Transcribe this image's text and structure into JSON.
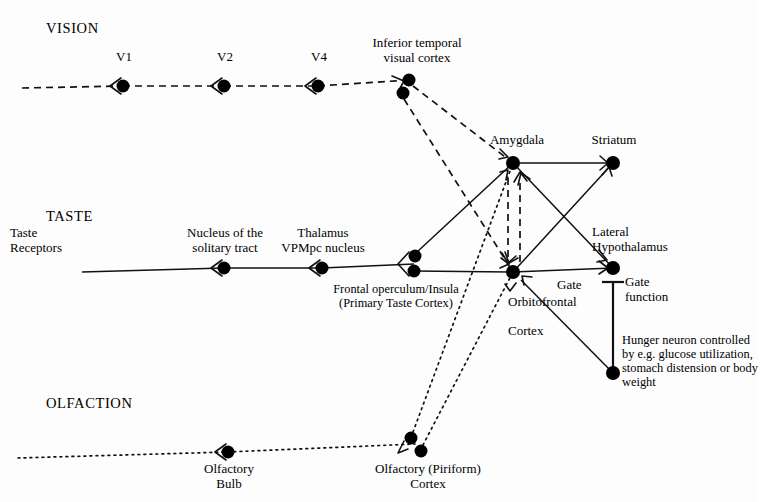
{
  "diagram": {
    "colors": {
      "ink": "#111111",
      "background": "#ffffff"
    },
    "modalities": [
      {
        "id": "vision",
        "label": "VISION",
        "x": 46,
        "y": 20
      },
      {
        "id": "taste",
        "label": "TASTE",
        "x": 46,
        "y": 208
      },
      {
        "id": "olfaction",
        "label": "OLFACTION",
        "x": 46,
        "y": 395
      }
    ],
    "labels": [
      {
        "id": "v1",
        "text": "V1",
        "x": 110,
        "y": 50,
        "align": "center",
        "width": 28,
        "size": "node-label"
      },
      {
        "id": "v2",
        "text": "V2",
        "x": 211,
        "y": 50,
        "align": "center",
        "width": 28,
        "size": "node-label"
      },
      {
        "id": "v4",
        "text": "V4",
        "x": 305,
        "y": 50,
        "align": "center",
        "width": 28,
        "size": "node-label"
      },
      {
        "id": "inferior-temporal-visual-cortex",
        "text": "Inferior temporal\nvisual cortex",
        "x": 358,
        "y": 36,
        "align": "center",
        "width": 118,
        "size": "node-label"
      },
      {
        "id": "amygdala",
        "text": "Amygdala",
        "x": 478,
        "y": 133,
        "align": "center",
        "width": 78,
        "size": "node-label"
      },
      {
        "id": "striatum",
        "text": "Striatum",
        "x": 578,
        "y": 133,
        "align": "center",
        "width": 72,
        "size": "node-label"
      },
      {
        "id": "taste-receptors",
        "text": "Taste\nReceptors",
        "x": 10,
        "y": 226,
        "align": "left",
        "width": 92,
        "size": "node-label"
      },
      {
        "id": "nucleus-solitary-tract",
        "text": "Nucleus of the\nsolitary tract",
        "x": 168,
        "y": 226,
        "align": "center",
        "width": 114,
        "size": "node-label"
      },
      {
        "id": "thalamus-vpmpc",
        "text": "Thalamus\nVPMpc nucleus",
        "x": 264,
        "y": 226,
        "align": "center",
        "width": 118,
        "size": "node-label"
      },
      {
        "id": "frontal-operculum-insula",
        "text": "Frontal operculum/Insula\n(Primary Taste Cortex)",
        "x": 305,
        "y": 283,
        "align": "center",
        "width": 182,
        "size": "small-label"
      },
      {
        "id": "lateral-hypothalamus",
        "text": "Lateral\nHypothalamus",
        "x": 592,
        "y": 225,
        "align": "left",
        "width": 116,
        "size": "node-label"
      },
      {
        "id": "gate",
        "text": "Gate",
        "x": 557,
        "y": 278,
        "align": "left",
        "width": 44,
        "size": "node-label"
      },
      {
        "id": "orbitofrontal-cortex",
        "text": "Orbitofrontal\n\nCortex",
        "x": 508,
        "y": 295,
        "align": "left",
        "width": 96,
        "size": "node-label"
      },
      {
        "id": "gate-function",
        "text": "Gate\nfunction",
        "x": 625,
        "y": 275,
        "align": "left",
        "width": 70,
        "size": "node-label"
      },
      {
        "id": "hunger-neuron",
        "text": "Hunger neuron controlled\nby e.g. glucose utilization,\nstomach distension or body\nweight",
        "x": 622,
        "y": 334,
        "align": "left",
        "width": 138,
        "size": "small-label"
      },
      {
        "id": "olfactory-bulb",
        "text": "Olfactory\nBulb",
        "x": 196,
        "y": 462,
        "align": "center",
        "width": 66,
        "size": "node-label"
      },
      {
        "id": "olfactory-piriform-cortex",
        "text": "Olfactory (Piriform)\nCortex",
        "x": 358,
        "y": 462,
        "align": "center",
        "width": 140,
        "size": "node-label"
      }
    ],
    "nodes": [
      {
        "id": "v1",
        "x": 123,
        "y": 86,
        "r": 6.5
      },
      {
        "id": "v2",
        "x": 224,
        "y": 86,
        "r": 6.5
      },
      {
        "id": "v4",
        "x": 318,
        "y": 86,
        "r": 6.5
      },
      {
        "id": "it-upper",
        "x": 409,
        "y": 80,
        "r": 6.5
      },
      {
        "id": "it-lower",
        "x": 403,
        "y": 93,
        "r": 6.5
      },
      {
        "id": "amygdala",
        "x": 513,
        "y": 163,
        "r": 7
      },
      {
        "id": "striatum",
        "x": 613,
        "y": 163,
        "r": 7
      },
      {
        "id": "nucleus-solitary",
        "x": 224,
        "y": 268,
        "r": 6.5
      },
      {
        "id": "thalamus-vpmpc",
        "x": 322,
        "y": 268,
        "r": 6.5
      },
      {
        "id": "operculum-upper",
        "x": 415,
        "y": 256,
        "r": 6.5
      },
      {
        "id": "operculum-lower",
        "x": 414,
        "y": 271,
        "r": 6.5
      },
      {
        "id": "orbitofrontal",
        "x": 513,
        "y": 272,
        "r": 7
      },
      {
        "id": "lateral-hypothalamus",
        "x": 613,
        "y": 268,
        "r": 7
      },
      {
        "id": "hunger-neuron",
        "x": 613,
        "y": 373,
        "r": 7
      },
      {
        "id": "olfactory-bulb",
        "x": 228,
        "y": 452,
        "r": 6.5
      },
      {
        "id": "piriform-upper",
        "x": 411,
        "y": 438,
        "r": 6.5
      },
      {
        "id": "piriform-lower",
        "x": 421,
        "y": 451,
        "r": 6.5
      }
    ],
    "edges": [
      {
        "id": "vision-in-v1",
        "style": "dashed",
        "from": [
          22,
          88
        ],
        "to": [
          123,
          86
        ]
      },
      {
        "id": "v1-v2",
        "style": "dashed",
        "from": [
          123,
          86
        ],
        "to": [
          224,
          86
        ]
      },
      {
        "id": "v2-v4",
        "style": "dashed",
        "from": [
          224,
          86
        ],
        "to": [
          318,
          86
        ]
      },
      {
        "id": "v4-it",
        "style": "dashed",
        "from": [
          318,
          86
        ],
        "to": [
          409,
          80
        ]
      },
      {
        "id": "it-amygdala",
        "style": "dashed",
        "from": [
          413,
          86
        ],
        "to": [
          513,
          163
        ]
      },
      {
        "id": "it-orbitofrontal",
        "style": "dashed",
        "from": [
          404,
          99
        ],
        "to": [
          513,
          272
        ]
      },
      {
        "id": "taste-in-nucleus",
        "style": "solid",
        "from": [
          82,
          272
        ],
        "to": [
          224,
          268
        ]
      },
      {
        "id": "nucleus-thalamus",
        "style": "solid",
        "from": [
          224,
          268
        ],
        "to": [
          322,
          268
        ]
      },
      {
        "id": "thalamus-operculum",
        "style": "solid",
        "from": [
          322,
          268
        ],
        "to": [
          414,
          264
        ]
      },
      {
        "id": "operculum-amygdala",
        "style": "solid",
        "from": [
          417,
          252
        ],
        "to": [
          513,
          163
        ]
      },
      {
        "id": "operculum-orbitofrontal",
        "style": "solid",
        "from": [
          414,
          271
        ],
        "to": [
          513,
          272
        ]
      },
      {
        "id": "amygdala-striatum",
        "style": "solid",
        "from": [
          513,
          163
        ],
        "to": [
          613,
          163
        ]
      },
      {
        "id": "amygdala-lateral-hypothalamus",
        "style": "solid",
        "from": [
          513,
          163
        ],
        "to": [
          613,
          268
        ]
      },
      {
        "id": "orbitofrontal-striatum",
        "style": "solid",
        "from": [
          513,
          272
        ],
        "to": [
          613,
          163
        ]
      },
      {
        "id": "orbitofrontal-lateral-hypothalamus",
        "style": "solid",
        "from": [
          513,
          272
        ],
        "to": [
          613,
          268
        ]
      },
      {
        "id": "amygdala-to-orbitofrontal",
        "style": "dashed-short",
        "from": [
          508,
          178
        ],
        "to": [
          508,
          262
        ]
      },
      {
        "id": "orbitofrontal-to-amygdala",
        "style": "dashed-short",
        "from": [
          520,
          262
        ],
        "to": [
          520,
          178
        ]
      },
      {
        "id": "hunger-gate-bar",
        "style": "thick",
        "from": [
          613,
          373
        ],
        "to": [
          613,
          282
        ]
      },
      {
        "id": "hunger-orbitofrontal-gate",
        "style": "solid",
        "from": [
          613,
          373
        ],
        "to": [
          521,
          280
        ]
      },
      {
        "id": "olfaction-in-bulb",
        "style": "dotted",
        "from": [
          18,
          458
        ],
        "to": [
          228,
          452
        ]
      },
      {
        "id": "bulb-piriform",
        "style": "dotted",
        "from": [
          228,
          452
        ],
        "to": [
          415,
          444
        ]
      },
      {
        "id": "piriform-amygdala",
        "style": "dotted",
        "from": [
          413,
          432
        ],
        "to": [
          513,
          163
        ]
      },
      {
        "id": "piriform-orbitofrontal",
        "style": "dotted",
        "from": [
          423,
          445
        ],
        "to": [
          513,
          272
        ]
      }
    ]
  }
}
